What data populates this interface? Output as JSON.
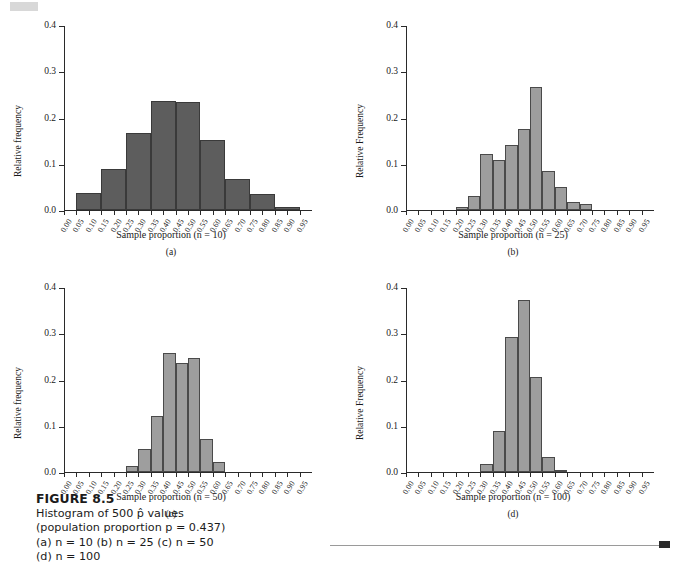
{
  "figure": {
    "number": "FIGURE 8.5",
    "line1": "Histogram of 500 p̂ values",
    "line2": "(population proportion p = 0.437)",
    "line3": "(a) n = 10 (b) n = 25 (c) n = 50",
    "line4": "(d) n = 100"
  },
  "colors": {
    "bar_dark": "#5d5d5d",
    "bar_light": "#9e9e9e",
    "bar_outline": "#4a4a4a",
    "axis": "#2a2a2a",
    "background": "#ffffff"
  },
  "axis": {
    "y_ticks": [
      "0.0",
      "0.1",
      "0.2",
      "0.3",
      "0.4"
    ],
    "y_values": [
      0.0,
      0.1,
      0.2,
      0.3,
      0.4
    ],
    "x_ticks": [
      "0.00",
      "0.05",
      "0.10",
      "0.15",
      "0.20",
      "0.25",
      "0.30",
      "0.35",
      "0.40",
      "0.45",
      "0.50",
      "0.55",
      "0.60",
      "0.65",
      "0.70",
      "0.75",
      "0.80",
      "0.85",
      "0.90",
      "0.95"
    ],
    "x_values": [
      0.0,
      0.05,
      0.1,
      0.15,
      0.2,
      0.25,
      0.3,
      0.35,
      0.4,
      0.45,
      0.5,
      0.55,
      0.6,
      0.65,
      0.7,
      0.75,
      0.8,
      0.85,
      0.9,
      0.95
    ]
  },
  "chart_data": [
    {
      "type": "bar",
      "panel": "a",
      "panel_letter": "(a)",
      "title": "",
      "xlabel": "Sample proportion (n = 10)",
      "ylabel": "Relative frequency",
      "ylim": [
        0.0,
        0.4
      ],
      "xlim": [
        0.0,
        1.0
      ],
      "bin_width": 0.05,
      "grid": false,
      "bin_starts": [
        0.0,
        0.05,
        0.1,
        0.15,
        0.2,
        0.25,
        0.3,
        0.35,
        0.4,
        0.45,
        0.5,
        0.55,
        0.6,
        0.65,
        0.7,
        0.75,
        0.8,
        0.85,
        0.9,
        0.95
      ],
      "categories": [
        "0.00",
        "0.05",
        "0.10",
        "0.15",
        "0.20",
        "0.25",
        "0.30",
        "0.35",
        "0.40",
        "0.45",
        "0.50",
        "0.55",
        "0.60",
        "0.65",
        "0.70",
        "0.75",
        "0.80",
        "0.85",
        "0.90",
        "0.95"
      ],
      "values": [
        0.0,
        0.0,
        0.036,
        0.036,
        0.089,
        0.089,
        0.167,
        0.167,
        0.236,
        0.236,
        0.234,
        0.234,
        0.152,
        0.152,
        0.066,
        0.066,
        0.034,
        0.034,
        0.006,
        0.006
      ],
      "bars": [
        {
          "start": 0.05,
          "end": 0.15,
          "value": 0.036
        },
        {
          "start": 0.15,
          "end": 0.25,
          "value": 0.089
        },
        {
          "start": 0.25,
          "end": 0.35,
          "value": 0.167
        },
        {
          "start": 0.35,
          "end": 0.45,
          "value": 0.236
        },
        {
          "start": 0.45,
          "end": 0.55,
          "value": 0.234
        },
        {
          "start": 0.55,
          "end": 0.65,
          "value": 0.152
        },
        {
          "start": 0.65,
          "end": 0.75,
          "value": 0.066
        },
        {
          "start": 0.75,
          "end": 0.85,
          "value": 0.034
        },
        {
          "start": 0.85,
          "end": 0.95,
          "value": 0.006
        }
      ]
    },
    {
      "type": "bar",
      "panel": "b",
      "panel_letter": "(b)",
      "title": "",
      "xlabel": "Sample proportion (n = 25)",
      "ylabel": "Relative Frequency",
      "ylim": [
        0.0,
        0.4
      ],
      "xlim": [
        0.0,
        1.0
      ],
      "bin_width": 0.05,
      "grid": false,
      "categories": [
        "0.20",
        "0.25",
        "0.30",
        "0.35",
        "0.40",
        "0.45",
        "0.50",
        "0.55",
        "0.60",
        "0.65",
        "0.70"
      ],
      "values": [
        0.006,
        0.031,
        0.121,
        0.109,
        0.141,
        0.175,
        0.266,
        0.084,
        0.05,
        0.018,
        0.012
      ],
      "bars": [
        {
          "start": 0.2,
          "end": 0.25,
          "value": 0.006
        },
        {
          "start": 0.25,
          "end": 0.3,
          "value": 0.031
        },
        {
          "start": 0.3,
          "end": 0.35,
          "value": 0.121
        },
        {
          "start": 0.35,
          "end": 0.4,
          "value": 0.109
        },
        {
          "start": 0.4,
          "end": 0.45,
          "value": 0.141
        },
        {
          "start": 0.45,
          "end": 0.5,
          "value": 0.175
        },
        {
          "start": 0.5,
          "end": 0.55,
          "value": 0.266
        },
        {
          "start": 0.55,
          "end": 0.6,
          "value": 0.084
        },
        {
          "start": 0.6,
          "end": 0.65,
          "value": 0.05
        },
        {
          "start": 0.65,
          "end": 0.7,
          "value": 0.018
        },
        {
          "start": 0.7,
          "end": 0.75,
          "value": 0.012
        }
      ]
    },
    {
      "type": "bar",
      "panel": "c",
      "panel_letter": "(c)",
      "title": "",
      "xlabel": "Sample proportion (n = 50)",
      "ylabel": "Relative frequency",
      "ylim": [
        0.0,
        0.4
      ],
      "xlim": [
        0.0,
        1.0
      ],
      "bin_width": 0.05,
      "grid": false,
      "categories": [
        "0.25",
        "0.30",
        "0.35",
        "0.40",
        "0.45",
        "0.50",
        "0.55",
        "0.60"
      ],
      "values": [
        0.012,
        0.05,
        0.122,
        0.258,
        0.236,
        0.247,
        0.071,
        0.021
      ],
      "bars": [
        {
          "start": 0.25,
          "end": 0.3,
          "value": 0.012
        },
        {
          "start": 0.3,
          "end": 0.35,
          "value": 0.05
        },
        {
          "start": 0.35,
          "end": 0.4,
          "value": 0.122
        },
        {
          "start": 0.4,
          "end": 0.45,
          "value": 0.258
        },
        {
          "start": 0.45,
          "end": 0.5,
          "value": 0.236
        },
        {
          "start": 0.5,
          "end": 0.55,
          "value": 0.247
        },
        {
          "start": 0.55,
          "end": 0.6,
          "value": 0.071
        },
        {
          "start": 0.6,
          "end": 0.65,
          "value": 0.021
        }
      ]
    },
    {
      "type": "bar",
      "panel": "d",
      "panel_letter": "(d)",
      "title": "",
      "xlabel": "Sample proportion (n = 100)",
      "ylabel": "Relative Frequency",
      "ylim": [
        0.0,
        0.4
      ],
      "xlim": [
        0.0,
        1.0
      ],
      "bin_width": 0.05,
      "grid": false,
      "categories": [
        "0.30",
        "0.35",
        "0.40",
        "0.45",
        "0.50",
        "0.55",
        "0.60"
      ],
      "values": [
        0.017,
        0.089,
        0.291,
        0.373,
        0.206,
        0.032,
        0.003
      ],
      "bars": [
        {
          "start": 0.3,
          "end": 0.35,
          "value": 0.017
        },
        {
          "start": 0.35,
          "end": 0.4,
          "value": 0.089
        },
        {
          "start": 0.4,
          "end": 0.45,
          "value": 0.291
        },
        {
          "start": 0.45,
          "end": 0.5,
          "value": 0.373
        },
        {
          "start": 0.5,
          "end": 0.55,
          "value": 0.206
        },
        {
          "start": 0.55,
          "end": 0.6,
          "value": 0.032
        },
        {
          "start": 0.6,
          "end": 0.65,
          "value": 0.003
        }
      ]
    }
  ]
}
